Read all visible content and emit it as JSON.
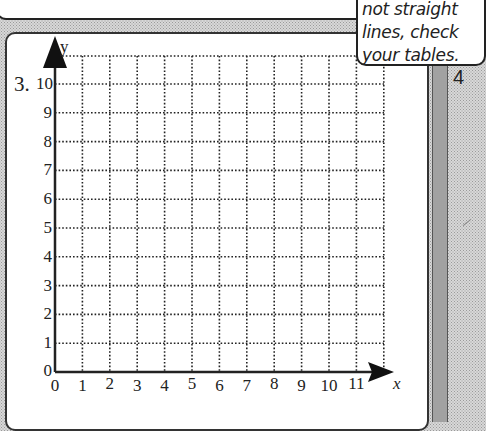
{
  "callout": {
    "line1": "not straight",
    "line2": "lines, check",
    "line3": "your tables."
  },
  "problem": {
    "number": "3.",
    "next_number": "4"
  },
  "graph": {
    "x_axis_label": "x",
    "y_axis_label": "y",
    "x_ticks": [
      "0",
      "1",
      "2",
      "3",
      "4",
      "5",
      "6",
      "7",
      "8",
      "9",
      "10",
      "11"
    ],
    "y_ticks": [
      "0",
      "1",
      "2",
      "3",
      "4",
      "5",
      "6",
      "7",
      "8",
      "9",
      "10"
    ],
    "grid_style": "dotted",
    "axis_color": "#222222"
  },
  "chart_data": {
    "type": "scatter",
    "title": "",
    "xlabel": "x",
    "ylabel": "y",
    "x": [],
    "values": [],
    "xlim": [
      0,
      12
    ],
    "ylim": [
      0,
      11
    ],
    "x_tick_labels": [
      "0",
      "1",
      "2",
      "3",
      "4",
      "5",
      "6",
      "7",
      "8",
      "9",
      "10",
      "11"
    ],
    "y_tick_labels": [
      "0",
      "1",
      "2",
      "3",
      "4",
      "5",
      "6",
      "7",
      "8",
      "9",
      "10"
    ],
    "grid": true,
    "legend": "none"
  }
}
